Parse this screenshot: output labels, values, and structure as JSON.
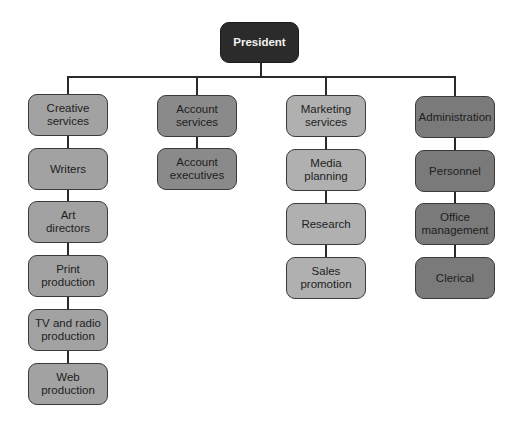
{
  "chart": {
    "root": {
      "label": "President"
    },
    "departments": [
      {
        "label": "Creative\nservices",
        "children": [
          "Writers",
          "Art\ndirectors",
          "Print\nproduction",
          "TV and radio\nproduction",
          "Web\nproduction"
        ]
      },
      {
        "label": "Account\nservices",
        "children": [
          "Account\nexecutives"
        ]
      },
      {
        "label": "Marketing\nservices",
        "children": [
          "Media\nplanning",
          "Research",
          "Sales\npromotion"
        ]
      },
      {
        "label": "Administration",
        "children": [
          "Personnel",
          "Office\nmanagement",
          "Clerical"
        ]
      }
    ],
    "colors": {
      "root": "#2b2b2b",
      "creative": "#a2a2a2",
      "account": "#8a8a8a",
      "marketing": "#b0b0b0",
      "administration": "#7a7a7a"
    }
  }
}
